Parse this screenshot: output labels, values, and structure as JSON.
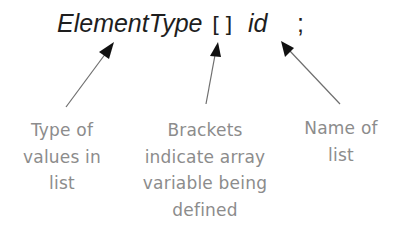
{
  "code": {
    "element_type": "ElementType",
    "brackets": "[]",
    "identifier": "id",
    "semicolon": ";"
  },
  "annotations": [
    {
      "target": "ElementType",
      "lines": [
        "Type of",
        "values in",
        "list"
      ]
    },
    {
      "target": "[]",
      "lines": [
        "Brackets",
        "indicate array",
        "variable being",
        "defined"
      ]
    },
    {
      "target": "id",
      "lines": [
        "Name of",
        "list"
      ]
    }
  ],
  "colors": {
    "code_text": "#1e1e1e",
    "caption_text": "#8c8c8c",
    "arrow_line": "#6e6e6e",
    "arrow_head": "#111111"
  }
}
